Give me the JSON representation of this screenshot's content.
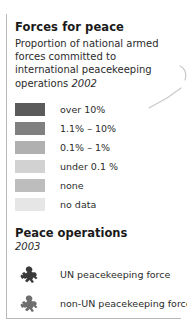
{
  "panel": {
    "title": "Forces for peace",
    "subtitle_text": "Proportion of national armed forces committed to international peacekeeping operations",
    "subtitle_year": "2002"
  },
  "key": {
    "items": [
      {
        "label": "over 10%",
        "color": "#5b5b5b"
      },
      {
        "label": "1.1% – 10%",
        "color": "#808080"
      },
      {
        "label": "0.1% – 1%",
        "color": "#b0b0b0"
      },
      {
        "label": "under 0.1 %",
        "color": "#d2d2d2"
      },
      {
        "label": "none",
        "color": "#bdbdbd"
      },
      {
        "label": "no data",
        "color": "#e6e6e6"
      }
    ]
  },
  "operations": {
    "title": "Peace operations",
    "year": "2003",
    "items": [
      {
        "label": "UN peacekeeping force",
        "icon": "peacekeeper-soldier-icon",
        "color": "#3a3a3a"
      },
      {
        "label": "non-UN peacekeeping force",
        "icon": "peacekeeper-soldier-icon",
        "color": "#6e6e6e"
      }
    ]
  },
  "decoration": {
    "map_line_color": "#c9c9c9"
  }
}
